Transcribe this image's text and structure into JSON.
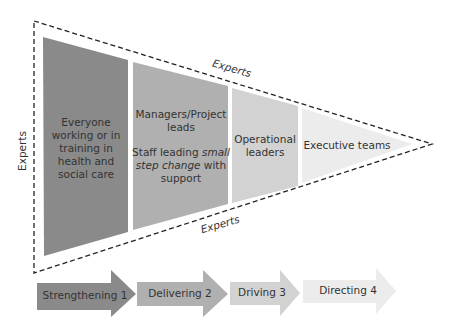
{
  "diagram": {
    "boundary_label": "Experts",
    "experts_labels": {
      "left": "Experts",
      "top": "Experts",
      "bottom": "Experts"
    },
    "panels": [
      {
        "lines": [
          "Everyone",
          "working or in",
          "training in",
          "health and",
          "social care"
        ],
        "color": "#8a8a8a"
      },
      {
        "line1": "Managers/Project",
        "line2": "leads",
        "line3_pre": "Staff leading ",
        "line3_em": "small",
        "line4_em": "step change",
        "line4_post": " with",
        "line5": "support",
        "color": "#b0b0b0"
      },
      {
        "lines": [
          "Operational",
          "leaders"
        ],
        "color": "#d2d2d2"
      },
      {
        "lines": [
          "Executive teams"
        ],
        "color": "#ececec"
      }
    ],
    "arrows": [
      {
        "label": "Strengthening 1",
        "color": "#8a8a8a"
      },
      {
        "label": "Delivering 2",
        "color": "#b0b0b0"
      },
      {
        "label": "Driving 3",
        "color": "#d2d2d2"
      },
      {
        "label": "Directing 4",
        "color": "#ececec"
      }
    ]
  }
}
